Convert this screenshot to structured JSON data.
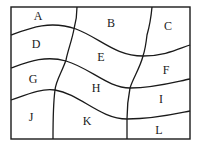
{
  "diagram": {
    "regions": [
      {
        "id": "A",
        "label": "A"
      },
      {
        "id": "B",
        "label": "B"
      },
      {
        "id": "C",
        "label": "C"
      },
      {
        "id": "D",
        "label": "D"
      },
      {
        "id": "E",
        "label": "E"
      },
      {
        "id": "F",
        "label": "F"
      },
      {
        "id": "G",
        "label": "G"
      },
      {
        "id": "H",
        "label": "H"
      },
      {
        "id": "I",
        "label": "I"
      },
      {
        "id": "J",
        "label": "J"
      },
      {
        "id": "K",
        "label": "K"
      },
      {
        "id": "L",
        "label": "L"
      }
    ],
    "line_color": "#1a1a1a"
  }
}
